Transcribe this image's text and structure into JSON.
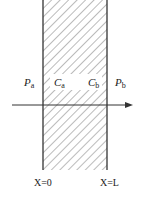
{
  "diagram": {
    "type": "membrane-permeation-schematic",
    "region": {
      "x_left": 43,
      "x_right": 107,
      "y_top": 0,
      "y_bottom": 170,
      "fill": "hatched",
      "line_color": "#333333"
    },
    "labels": {
      "pa": {
        "main": "P",
        "sub": "a"
      },
      "ca": {
        "main": "C",
        "sub": "a"
      },
      "cb": {
        "main": "C",
        "sub": "b"
      },
      "pb": {
        "main": "P",
        "sub": "b"
      },
      "x0": "X=0",
      "xl": "X=L"
    },
    "arrow": {
      "direction": "right",
      "y": 105,
      "x_start": 12,
      "x_end": 133
    }
  }
}
